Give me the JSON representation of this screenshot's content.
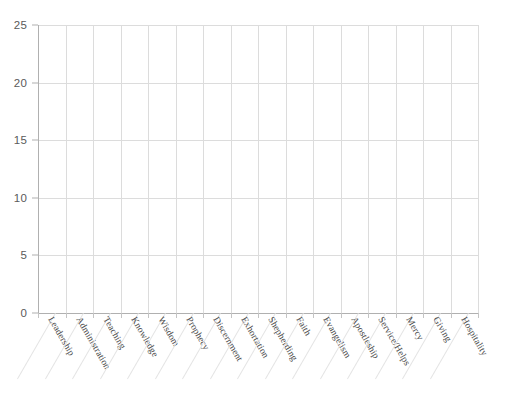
{
  "chart_data": {
    "type": "bar",
    "title": "",
    "subtitle": "",
    "xlabel": "",
    "ylabel": "",
    "ylim": [
      0,
      25
    ],
    "yticks": [
      0,
      5,
      10,
      15,
      20,
      25
    ],
    "ytick_labels": [
      "0",
      "5",
      "10",
      "15",
      "20",
      "25"
    ],
    "grid": true,
    "legend": "none",
    "categories": [
      "Leadership",
      "Administration",
      "Teaching",
      "Knowledge",
      "Wisdom",
      "Prophecy",
      "Discernment",
      "Exhortation",
      "Shepherding",
      "Faith",
      "Evangelism",
      "Apostleship",
      "Service/Helps",
      "Mercy",
      "Giving",
      "Hospitality"
    ],
    "values": [
      0,
      0,
      0,
      0,
      0,
      0,
      0,
      0,
      0,
      0,
      0,
      0,
      0,
      0,
      0,
      0
    ],
    "annotations": []
  },
  "style": {
    "background_color": "#ffffff",
    "grid_color": "#dcdcdc",
    "axis_color": "#b0b0b0",
    "tick_label_color": "#5a5a5a",
    "category_label_color": "#4a4a4a"
  }
}
